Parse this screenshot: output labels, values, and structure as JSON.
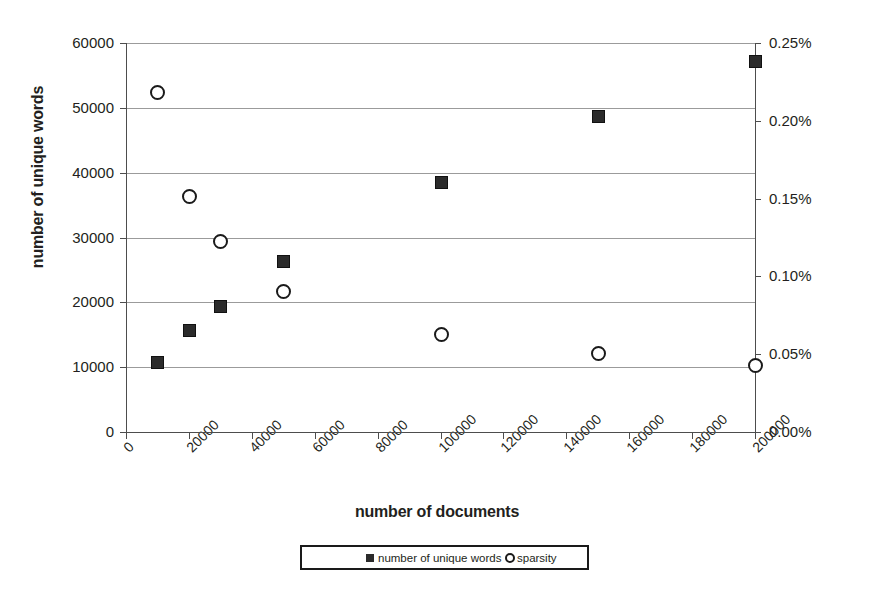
{
  "chart_data": {
    "type": "scatter",
    "title": "",
    "xlabel": "number of documents",
    "ylabel": "number of unique words",
    "y2label": "non-zero values in feature vectors",
    "xlim": [
      0,
      200000
    ],
    "ylim": [
      0,
      60000
    ],
    "y2lim": [
      0.0,
      0.25
    ],
    "xticks": [
      0,
      20000,
      40000,
      60000,
      80000,
      100000,
      120000,
      140000,
      160000,
      180000,
      200000
    ],
    "xticklabels": [
      "0",
      "20000",
      "40000",
      "60000",
      "80000",
      "100000",
      "120000",
      "140000",
      "160000",
      "180000",
      "200000"
    ],
    "yticks": [
      0,
      10000,
      20000,
      30000,
      40000,
      50000,
      60000
    ],
    "yticklabels": [
      "0",
      "10000",
      "20000",
      "30000",
      "40000",
      "50000",
      "60000"
    ],
    "y2ticks": [
      0.0,
      0.05,
      0.1,
      0.15,
      0.2,
      0.25
    ],
    "y2ticklabels": [
      "0.00%",
      "0.05%",
      "0.10%",
      "0.15%",
      "0.20%",
      "0.25%"
    ],
    "grid": true,
    "legend_position": "bottom",
    "series": [
      {
        "name": "number of unique words",
        "marker": "filled-square",
        "axis": "left",
        "color": "#2b2b2b",
        "points": [
          {
            "x": 10000,
            "y": 10800
          },
          {
            "x": 20000,
            "y": 15800
          },
          {
            "x": 30000,
            "y": 19500
          },
          {
            "x": 50000,
            "y": 26400
          },
          {
            "x": 100000,
            "y": 38500
          },
          {
            "x": 150000,
            "y": 48700
          },
          {
            "x": 200000,
            "y": 57200
          }
        ]
      },
      {
        "name": "sparsity",
        "marker": "open-circle",
        "axis": "right",
        "color": "#1a1a1a",
        "points": [
          {
            "x": 10000,
            "y": 0.2185
          },
          {
            "x": 20000,
            "y": 0.1515
          },
          {
            "x": 30000,
            "y": 0.1225
          },
          {
            "x": 50000,
            "y": 0.0905
          },
          {
            "x": 100000,
            "y": 0.063
          },
          {
            "x": 150000,
            "y": 0.0505
          },
          {
            "x": 200000,
            "y": 0.043
          }
        ]
      }
    ]
  },
  "legend": {
    "items": [
      {
        "label": "number of unique words",
        "marker": "filled-square"
      },
      {
        "label": "sparsity",
        "marker": "open-circle"
      }
    ]
  }
}
